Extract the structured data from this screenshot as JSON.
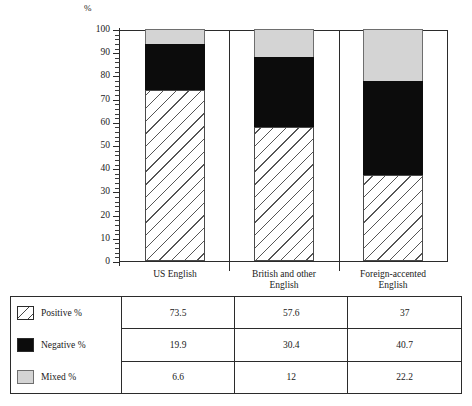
{
  "chart_data": {
    "type": "bar",
    "subtype": "stacked-bar-100",
    "title": "",
    "xlabel": "",
    "ylabel": "%",
    "ylim": [
      0,
      100
    ],
    "ytick_step": 10,
    "yminor_step": 2,
    "grid": false,
    "legend_position": "table-below",
    "categories": [
      "US English",
      "British and other English",
      "Foreign-accented English"
    ],
    "category_lines": [
      [
        "US English"
      ],
      [
        "British and other",
        "English"
      ],
      [
        "Foreign-accented",
        "English"
      ]
    ],
    "series": [
      {
        "name": "Positive %",
        "values": [
          73.5,
          57.6,
          37
        ],
        "fill": "hatched-diagonal",
        "color": "#ffffff"
      },
      {
        "name": "Negative %",
        "values": [
          19.9,
          30.4,
          40.7
        ],
        "fill": "solid",
        "color": "#0c0c0c"
      },
      {
        "name": "Mixed %",
        "values": [
          6.6,
          12,
          22.2
        ],
        "fill": "solid",
        "color": "#d4d4d4"
      }
    ],
    "ytick_labels": [
      "0",
      "10",
      "20",
      "30",
      "40",
      "50",
      "60",
      "70",
      "80",
      "90",
      "100"
    ]
  },
  "axis": {
    "unit_label": "%"
  },
  "table": {
    "rows": [
      {
        "label": "Positive %",
        "swatch": "hatched-swatch",
        "values": [
          "73.5",
          "57.6",
          "37"
        ]
      },
      {
        "label": "Negative %",
        "swatch": "black-swatch",
        "values": [
          "19.9",
          "30.4",
          "40.7"
        ]
      },
      {
        "label": "Mixed %",
        "swatch": "gray-swatch",
        "values": [
          "6.6",
          "12",
          "22.2"
        ]
      }
    ]
  },
  "colors": {
    "axis": "#2b2b2b",
    "negative": "#0c0c0c",
    "mixed": "#d4d4d4",
    "positive_outline": "#4a4a4a"
  }
}
